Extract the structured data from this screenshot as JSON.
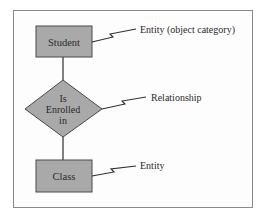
{
  "diagram": {
    "type": "entity-relationship",
    "nodes": [
      {
        "id": "student",
        "shape": "rectangle",
        "lines": [
          "Student"
        ]
      },
      {
        "id": "is-enrolled-in",
        "shape": "diamond",
        "lines": [
          "Is",
          "Enrolled",
          "in"
        ]
      },
      {
        "id": "class",
        "shape": "rectangle",
        "lines": [
          "Class"
        ]
      }
    ],
    "edges": [
      {
        "from": "student",
        "to": "is-enrolled-in"
      },
      {
        "from": "is-enrolled-in",
        "to": "class"
      }
    ],
    "annotations": [
      {
        "target": "student",
        "text": "Entity (object category)"
      },
      {
        "target": "is-enrolled-in",
        "text": "Relationship"
      },
      {
        "target": "class",
        "text": "Entity"
      }
    ]
  },
  "colors": {
    "shape_fill": "#a9a9a9",
    "shape_stroke": "#4a4a4a",
    "line": "#2e2e2e",
    "frame": "#8a8a8a"
  }
}
